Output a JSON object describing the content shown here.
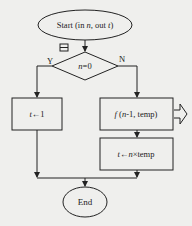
{
  "flowchart": {
    "start": {
      "label": "Start (in n, out t)",
      "parts": [
        "Start (in ",
        "n",
        ", out ",
        "t",
        ")"
      ]
    },
    "decision": {
      "label": "n=0",
      "var": "n",
      "rest": "=0",
      "collapse_icon": "minus-box-icon"
    },
    "branches": {
      "yes": "Y",
      "no": "N"
    },
    "yes_process": {
      "label": "t←1",
      "var": "t",
      "rest": "←1"
    },
    "no_process_1": {
      "label": "f (n-1, temp)",
      "func": "f",
      "args_pre": " (",
      "var": "n",
      "args_post": "-1, temp)",
      "expand_icon": "outline-arrow-right-icon"
    },
    "no_process_2": {
      "label": "t←n×temp",
      "var1": "t",
      "arrow": "←",
      "var2": "n",
      "rest": "×temp"
    },
    "end": {
      "label": "End"
    }
  },
  "colors": {
    "stroke": "#222222",
    "background": "#efefed",
    "text": "#222222"
  }
}
